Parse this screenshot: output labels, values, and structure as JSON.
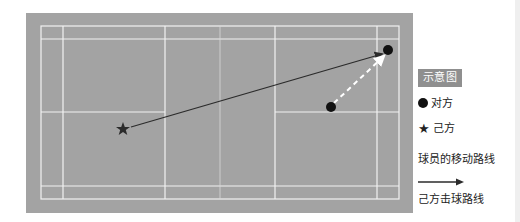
{
  "diagram": {
    "type": "badminton-court-tactic",
    "colors": {
      "court": "#a3a3a3",
      "lines": "#f2f2f2",
      "shot_line": "#2b2b2b",
      "move_line": "#ffffff",
      "marker": "#111111",
      "legend_title_bg": "#8f8f8f"
    },
    "players": {
      "opponent_start": {
        "x": 331,
        "y": 107
      },
      "opponent_end": {
        "x": 388,
        "y": 50
      },
      "self": {
        "x": 123,
        "y": 129
      }
    },
    "shot_path": {
      "from": [
        131,
        127
      ],
      "to": [
        382,
        54
      ]
    },
    "move_path": {
      "from": [
        334,
        103
      ],
      "to": [
        384,
        55
      ]
    }
  },
  "legend": {
    "title": "示意图",
    "opponent": "对方",
    "self": "己方",
    "movement_route": "球员的移动路线",
    "shot_route": "己方击球路线"
  }
}
